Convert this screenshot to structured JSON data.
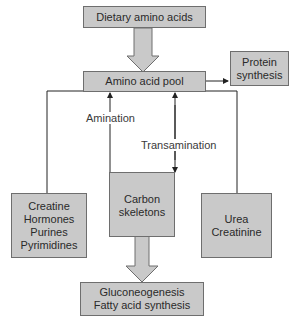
{
  "diagram": {
    "nodes": {
      "dietary": {
        "lines": [
          "Dietary amino acids"
        ]
      },
      "pool": {
        "lines": [
          "Amino acid pool"
        ]
      },
      "protein": {
        "lines": [
          "Protein",
          "synthesis"
        ]
      },
      "creatine": {
        "lines": [
          "Creatine",
          "Hormones",
          "Purines",
          "Pyrimidines"
        ]
      },
      "carbon": {
        "lines": [
          "Carbon",
          "skeletons"
        ]
      },
      "urea": {
        "lines": [
          "Urea",
          "Creatinine"
        ]
      },
      "gluco": {
        "lines": [
          "Gluconeogenesis",
          "Fatty acid synthesis"
        ]
      }
    },
    "edge_labels": {
      "amination": "Amination",
      "transamination": "Transamination"
    },
    "colors": {
      "box_fill": "#c9c9c9",
      "box_border": "#6e6e6e",
      "line": "#222222"
    }
  }
}
